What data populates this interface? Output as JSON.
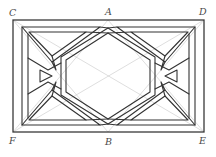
{
  "figure": {
    "background_color": "#ffffff",
    "stroke_color": "#333333",
    "construction_color": "#b9b9b9",
    "label_color": "#4a4a4a",
    "band_stroke_width": 1.1,
    "construction_stroke_width": 0.5,
    "frame_stroke_width": 1.2
  },
  "labels": [
    {
      "id": "C",
      "text": "C",
      "x": 9,
      "y": 8,
      "role": "top-left-corner"
    },
    {
      "id": "A",
      "text": "A",
      "x": 105,
      "y": 7,
      "role": "top-midpoint"
    },
    {
      "id": "D",
      "text": "D",
      "x": 199,
      "y": 7,
      "role": "top-right-corner"
    },
    {
      "id": "F",
      "text": "F",
      "x": 9,
      "y": 136,
      "role": "bottom-left-corner"
    },
    {
      "id": "B",
      "text": "B",
      "x": 105,
      "y": 137,
      "role": "bottom-midpoint"
    },
    {
      "id": "E",
      "text": "E",
      "x": 199,
      "y": 136,
      "role": "bottom-right-corner"
    }
  ],
  "geometry": {
    "rectangle": {
      "name": "CDEF",
      "left": 13,
      "top": 20,
      "right": 204,
      "bottom": 132,
      "width": 191,
      "height": 112
    },
    "points": {
      "C": [
        13,
        20
      ],
      "A": [
        108,
        20
      ],
      "D": [
        204,
        20
      ],
      "F": [
        13,
        132
      ],
      "B": [
        108,
        132
      ],
      "E": [
        204,
        132
      ]
    },
    "construction_lines": [
      {
        "name": "C-B",
        "from": "C",
        "to": "B"
      },
      {
        "name": "C-E",
        "from": "C",
        "to": "E"
      },
      {
        "name": "D-B",
        "from": "D",
        "to": "B"
      },
      {
        "name": "D-F",
        "from": "D",
        "to": "F"
      },
      {
        "name": "A-F",
        "from": "A",
        "to": "F"
      },
      {
        "name": "A-E",
        "from": "A",
        "to": "E"
      }
    ],
    "central_hexagon": {
      "vertices": [
        [
          108,
          31
        ],
        [
          152,
          59
        ],
        [
          152,
          93
        ],
        [
          108,
          121
        ],
        [
          64,
          93
        ],
        [
          64,
          59
        ]
      ]
    },
    "corner_triangles": [
      "top-left",
      "top-right",
      "bottom-left",
      "bottom-right"
    ],
    "side_knots": [
      "left-eye",
      "right-eye"
    ]
  }
}
